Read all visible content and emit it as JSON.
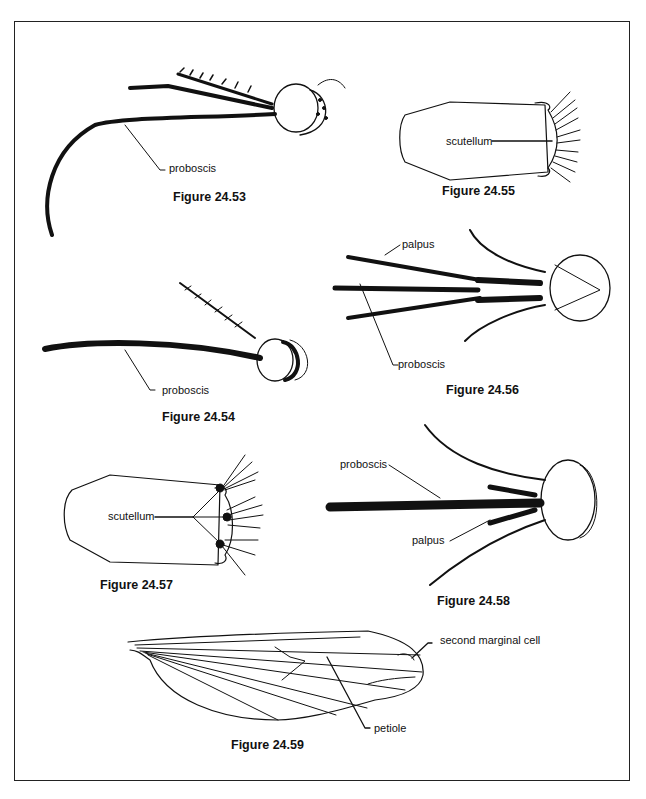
{
  "figures": [
    {
      "id": "24.53",
      "caption": "Figure 24.53",
      "labels": [
        "proboscis"
      ]
    },
    {
      "id": "24.54",
      "caption": "Figure 24.54",
      "labels": [
        "proboscis"
      ]
    },
    {
      "id": "24.55",
      "caption": "Figure 24.55",
      "labels": [
        "scutellum"
      ]
    },
    {
      "id": "24.56",
      "caption": "Figure 24.56",
      "labels": [
        "palpus",
        "proboscis"
      ]
    },
    {
      "id": "24.57",
      "caption": "Figure 24.57",
      "labels": [
        "scutellum"
      ]
    },
    {
      "id": "24.58",
      "caption": "Figure 24.58",
      "labels": [
        "proboscis",
        "palpus"
      ]
    },
    {
      "id": "24.59",
      "caption": "Figure 24.59",
      "labels": [
        "second marginal cell",
        "petiole"
      ]
    }
  ]
}
